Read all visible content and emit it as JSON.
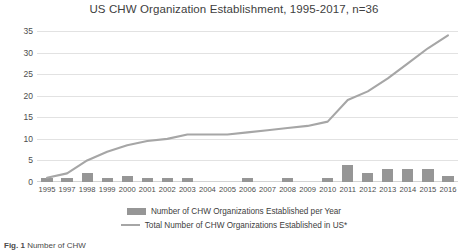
{
  "chart_data": {
    "type": "bar",
    "title": "US CHW Organization Establishment, 1995-2017, n=36",
    "xlabel": "",
    "ylabel": "",
    "ylim": [
      0,
      35
    ],
    "ytick_step": 5,
    "yticks": [
      "35",
      "30",
      "25",
      "20",
      "15",
      "10",
      "5",
      "0"
    ],
    "grid": true,
    "legend_position": "bottom",
    "categories": [
      "1995",
      "1997",
      "1998",
      "1999",
      "2000",
      "2001",
      "2002",
      "2003",
      "2004",
      "2005",
      "2006",
      "2007",
      "2008",
      "2009",
      "2010",
      "2011",
      "2012",
      "2013",
      "2014",
      "2015",
      "2016"
    ],
    "series": [
      {
        "name": "Number of CHW Organizations Established per Year",
        "type": "bar",
        "color": "#969696",
        "values": [
          1,
          1,
          2,
          1,
          1.5,
          1,
          1,
          1,
          0,
          0,
          1,
          0,
          1,
          0,
          1,
          4,
          2,
          3,
          3,
          3,
          1.5
        ]
      },
      {
        "name": "Total Number of CHW Organizations Established in US*",
        "type": "line",
        "color": "#a6a6a6",
        "values": [
          1,
          2,
          5,
          7,
          8.5,
          9.5,
          10,
          11,
          11,
          11,
          11.5,
          12,
          12.5,
          13,
          14,
          19,
          21,
          24,
          27.5,
          31,
          34
        ]
      }
    ]
  },
  "legend": {
    "items": [
      {
        "label": "Number of CHW Organizations Established per Year",
        "marker": "bar-swatch"
      },
      {
        "label": "Total Number of CHW Organizations Established in US*",
        "marker": "line-swatch"
      }
    ]
  },
  "caption": {
    "prefix": "Fig. 1",
    "text": "Number of CHW"
  }
}
